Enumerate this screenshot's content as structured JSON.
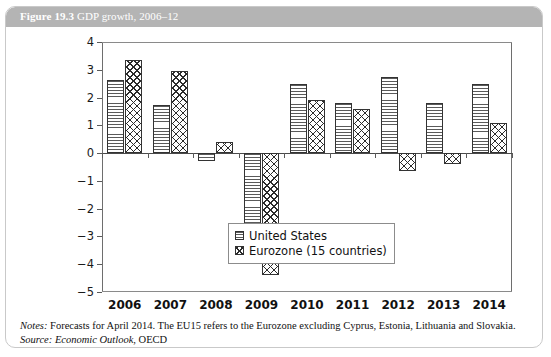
{
  "figure": {
    "number": "Figure 19.3",
    "title": "GDP growth, 2006–12"
  },
  "notes": {
    "notes_label": "Notes:",
    "notes_text": " Forecasts for April 2014. The EU15 refers to the Eurozone excluding Cyprus, Estonia, Lithuania and Slovakia.",
    "source_label": "Source:",
    "source_italic": " Economic Outlook",
    "source_rest": ", OECD"
  },
  "chart_data": {
    "type": "bar",
    "title": "GDP growth, 2006–12",
    "xlabel": "",
    "ylabel": "",
    "ylim": [
      -5,
      4
    ],
    "yticks": [
      4,
      3,
      2,
      1,
      0,
      -1,
      -2,
      -3,
      -4,
      -5
    ],
    "ytick_labels": [
      "4",
      "3",
      "2",
      "1",
      "0",
      "−1",
      "−2",
      "−3",
      "−4",
      "−5"
    ],
    "categories": [
      "2006",
      "2007",
      "2008",
      "2009",
      "2010",
      "2011",
      "2012",
      "2013",
      "2014"
    ],
    "grid": false,
    "legend_position": "inside-bottom-center",
    "series": [
      {
        "name": "United States",
        "pattern": "horizontal-wave-hatch",
        "values": [
          2.65,
          1.75,
          -0.3,
          -2.85,
          2.5,
          1.8,
          2.75,
          1.8,
          2.5
        ]
      },
      {
        "name": "Eurozone (15 countries)",
        "pattern": "diagonal-cross-hatch",
        "values": [
          3.35,
          2.95,
          0.4,
          -4.4,
          1.9,
          1.6,
          -0.65,
          -0.4,
          1.1
        ]
      }
    ]
  }
}
